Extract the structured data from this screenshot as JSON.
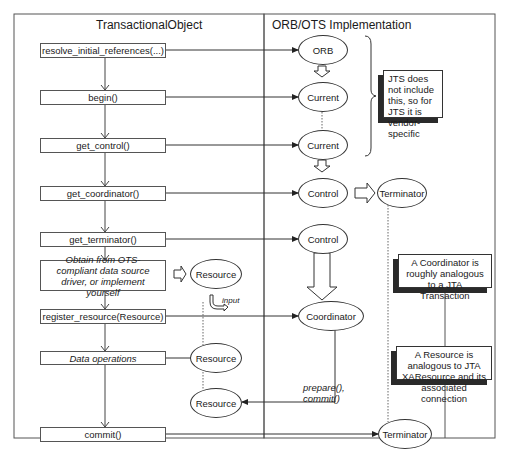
{
  "headers": {
    "left": "TransactionalObject",
    "right": "ORB/OTS Implementation"
  },
  "steps": [
    {
      "label": "resolve_initial_references(...)",
      "italic": false
    },
    {
      "label": "begin()",
      "italic": false
    },
    {
      "label": "get_control()",
      "italic": false
    },
    {
      "label": "get_coordinator()",
      "italic": false
    },
    {
      "label": "get_terminator()",
      "italic": false
    },
    {
      "label": "Obtain from OTS-compliant data source driver, or implement yourself",
      "italic": true
    },
    {
      "label": "register_resource(Resource)",
      "italic": false
    },
    {
      "label": "Data operations",
      "italic": true
    },
    {
      "label": "commit()",
      "italic": false
    }
  ],
  "objects": {
    "orb": "ORB",
    "current1": "Current",
    "current2": "Current",
    "control1": "Control",
    "terminator1": "Terminator",
    "control2": "Control",
    "coordinator": "Coordinator",
    "resource1": "Resource",
    "resource2": "Resource",
    "resource3": "Resource",
    "terminator2": "Terminator"
  },
  "annotations": {
    "input": "input",
    "prepare_commit_1": "prepare(),",
    "prepare_commit_2": "commit()"
  },
  "notes": {
    "jts": "JTS does not include this, so for JTS it is vendor-specific",
    "coordinator": "A Coordinator is roughly analogous to a JTA Transaction",
    "resource": "A Resource is analogous to JTA XAResource and its associated connection"
  }
}
